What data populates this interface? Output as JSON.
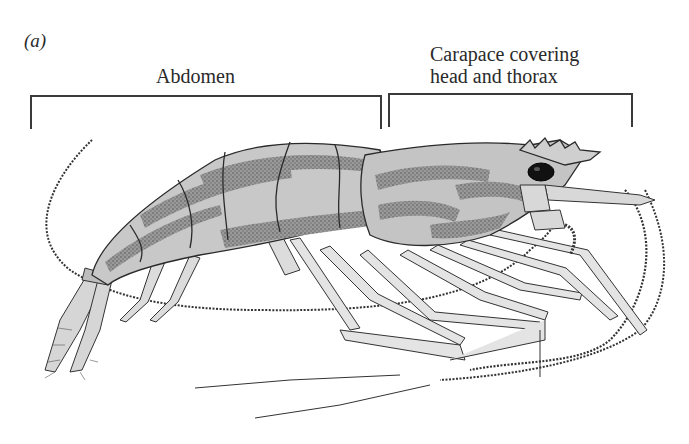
{
  "figure": {
    "panel_label": "(a)",
    "labels": {
      "abdomen": "Abdomen",
      "carapace_line1": "Carapace covering",
      "carapace_line2": "head and thorax"
    },
    "colors": {
      "ink": "#2a2a2a",
      "body_light": "#c9c9c9",
      "body_dark": "#8a8a8a",
      "leg_fill": "#dedede",
      "eye": "#111111",
      "background": "#ffffff"
    }
  }
}
